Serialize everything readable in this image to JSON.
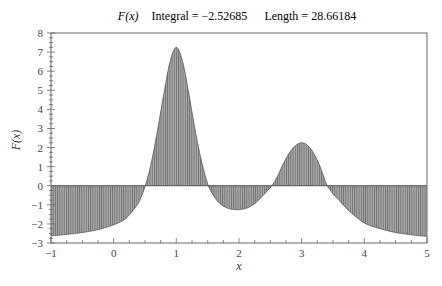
{
  "chart_data": {
    "type": "area",
    "title": {
      "function": "F(x)",
      "integral_label": "Integral = −2.52685",
      "length_label": "Length = 28.66184"
    },
    "xlabel": "x",
    "ylabel": "F(x)",
    "xlim": [
      -1,
      5
    ],
    "ylim": [
      -3,
      8
    ],
    "xticks": [
      -1,
      0,
      1,
      2,
      3,
      4,
      5
    ],
    "yticks": [
      -3,
      -2,
      -1,
      0,
      1,
      2,
      3,
      4,
      5,
      6,
      7,
      8
    ],
    "grid": false,
    "fill": "vertical hatched shading between curve and y=0",
    "fill_color": "#8c8c8c",
    "line_color": "#555555",
    "series": [
      {
        "name": "F(x)",
        "x": [
          -1,
          -0.75,
          -0.5,
          -0.25,
          0,
          0.2,
          0.4,
          0.5,
          0.6,
          0.7,
          0.8,
          0.9,
          1.0,
          1.1,
          1.2,
          1.3,
          1.4,
          1.5,
          1.6,
          1.7,
          1.8,
          1.9,
          2.0,
          2.1,
          2.2,
          2.3,
          2.4,
          2.5,
          2.6,
          2.7,
          2.8,
          2.9,
          3.0,
          3.1,
          3.2,
          3.3,
          3.4,
          3.5,
          3.75,
          4.0,
          4.25,
          4.5,
          4.75,
          5.0
        ],
        "y": [
          -2.62,
          -2.55,
          -2.45,
          -2.3,
          -2.05,
          -1.7,
          -0.9,
          -0.05,
          1.2,
          2.9,
          4.8,
          6.5,
          7.25,
          6.5,
          4.8,
          2.9,
          1.3,
          0.1,
          -0.55,
          -0.95,
          -1.15,
          -1.24,
          -1.25,
          -1.2,
          -1.05,
          -0.8,
          -0.45,
          -0.1,
          0.4,
          1.1,
          1.7,
          2.1,
          2.25,
          2.1,
          1.65,
          0.95,
          0.05,
          -0.45,
          -1.3,
          -1.95,
          -2.25,
          -2.45,
          -2.57,
          -2.65
        ]
      }
    ],
    "annotations": {
      "integral": -2.52685,
      "length": 28.66184
    }
  }
}
